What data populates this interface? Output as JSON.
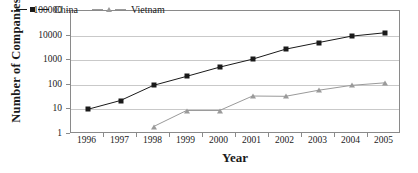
{
  "chart_data": {
    "type": "line",
    "title": "",
    "xlabel": "Year",
    "ylabel": "Number of Companies",
    "x": [
      1996,
      1997,
      1998,
      1999,
      2000,
      2001,
      2002,
      2003,
      2004,
      2005
    ],
    "xtick_labels": [
      "1996",
      "1997",
      "1998",
      "1999",
      "2000",
      "2001",
      "2002",
      "2003",
      "2004",
      "2005"
    ],
    "yscale": "log",
    "ylim": [
      1,
      100000
    ],
    "ytick_values": [
      1,
      10,
      100,
      1000,
      10000,
      100000
    ],
    "ytick_labels": [
      "1",
      "10",
      "100",
      "1000",
      "10000",
      "100000"
    ],
    "grid": "horizontal",
    "legend_position": "top-left-inside",
    "series": [
      {
        "name": "China",
        "color": "#1a1a1a",
        "marker": "square",
        "values": [
          10,
          23,
          95,
          220,
          520,
          1100,
          2800,
          5200,
          9500,
          13000
        ]
      },
      {
        "name": "Vietnam",
        "color": "#9a9a9a",
        "marker": "triangle",
        "values": [
          null,
          null,
          2,
          9,
          9,
          35,
          34,
          60,
          95,
          120
        ]
      }
    ]
  },
  "axes": {
    "y_title": "Number of Companies",
    "x_title": "Year"
  },
  "legend": {
    "items": [
      {
        "label": "China",
        "color": "#1a1a1a"
      },
      {
        "label": "Vietnam",
        "color": "#9a9a9a"
      }
    ]
  }
}
